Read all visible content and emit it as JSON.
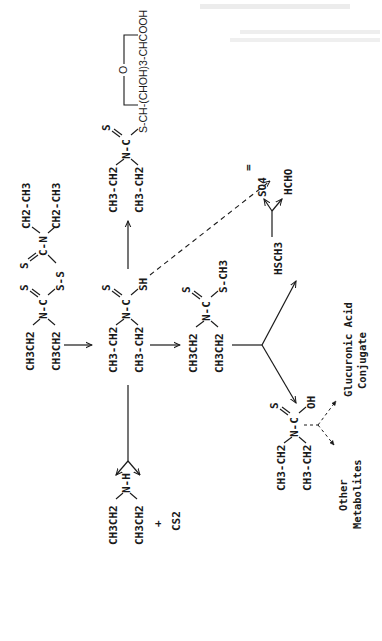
{
  "figure": {
    "orientation": "rotated 90 degrees counterclockwise",
    "background": "#ffffff",
    "ink": "#1a1a1a",
    "header_faint_text": [
      "(illegible faint text)",
      "(illegible faint text)"
    ]
  },
  "compounds": {
    "disulfiram": {
      "left_ethyl_top": "CH3CH2",
      "left_ethyl_bottom": "CH3CH2",
      "n": "N-C",
      "thione_s": "S",
      "s_s": "S-S",
      "right_thione_s": "S",
      "right_c_n": "C-N",
      "right_ethyl_top": "CH2-CH3",
      "right_ethyl_bottom": "CH2-CH3"
    },
    "ddc_acid": {
      "ethyl_top": "CH3-CH2",
      "ethyl_bottom": "CH3-CH2",
      "n": "N-C",
      "thione_s": "S",
      "sh": "SH"
    },
    "glucuronide": {
      "ethyl_top": "CH3-CH2",
      "ethyl_bottom": "CH3-CH2",
      "n": "N-C",
      "thione_s": "S",
      "chain": "S-CH-(CHOH)3-CHCOOH",
      "ring_o": "O"
    },
    "diethylamine": {
      "ethyl_top": "CH3CH2",
      "ethyl_bottom": "CH3CH2",
      "nh": "N-H",
      "plus": "+",
      "cs2": "CS2"
    },
    "methyl_ester": {
      "ethyl_top": "CH3CH2",
      "ethyl_bottom": "CH3CH2",
      "n": "N-C",
      "thione_s": "S",
      "s_ch3": "S-CH3"
    },
    "monothiocarbamate": {
      "ethyl_top": "CH3-CH2",
      "ethyl_bottom": "CH3-CH2",
      "n": "N-C",
      "thione_s": "S",
      "oh": "OH"
    },
    "methanethiol": {
      "label": "HSCH3"
    },
    "formaldehyde": {
      "label": "HCHO"
    },
    "sulfate": {
      "label": "SO4",
      "charge": "="
    }
  },
  "labels": {
    "glucuronic_line1": "Glucuronic Acid",
    "glucuronic_line2": "Conjugate",
    "other_line1": "Other",
    "other_line2": "Metabolites"
  }
}
